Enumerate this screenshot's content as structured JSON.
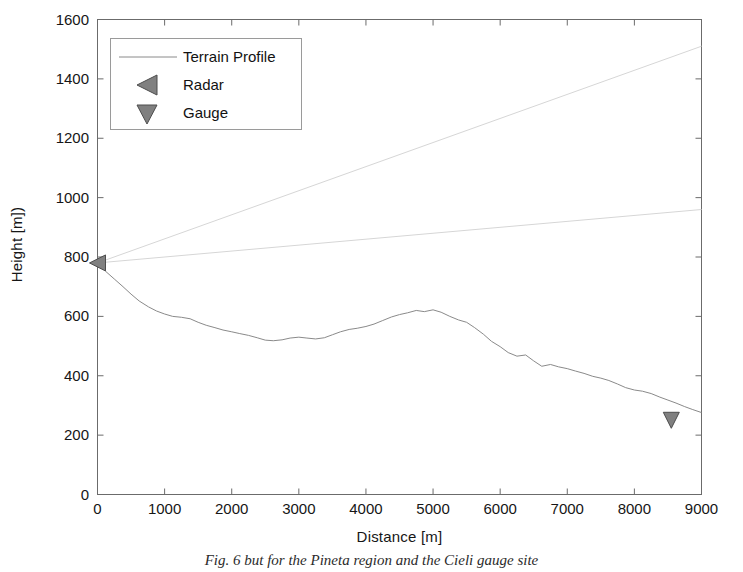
{
  "chart_data": {
    "type": "line",
    "title": "",
    "xlabel": "Distance [m]",
    "ylabel": "Height [m])",
    "xlim": [
      0,
      9000
    ],
    "ylim": [
      0,
      1600
    ],
    "xticks": [
      0,
      1000,
      2000,
      3000,
      4000,
      5000,
      6000,
      7000,
      8000,
      9000
    ],
    "yticks": [
      0,
      200,
      400,
      600,
      800,
      1000,
      1200,
      1400,
      1600
    ],
    "xtick_labels": [
      "0",
      "1000",
      "2000",
      "3000",
      "4000",
      "5000",
      "6000",
      "7000",
      "8000",
      "9000"
    ],
    "ytick_labels": [
      "0",
      "200",
      "400",
      "600",
      "800",
      "1000",
      "1200",
      "1400",
      "1600"
    ],
    "grid": false,
    "legend_position": "upper left",
    "legend_entries": [
      "Terrain Profile",
      "Radar",
      "Gauge"
    ],
    "series": [
      {
        "name": "Terrain Profile",
        "type": "line",
        "color": "#8a8a8a",
        "x": [
          0,
          120,
          250,
          380,
          500,
          620,
          760,
          880,
          1000,
          1120,
          1250,
          1380,
          1500,
          1620,
          1750,
          1870,
          2000,
          2120,
          2250,
          2380,
          2500,
          2620,
          2750,
          2870,
          3000,
          3120,
          3250,
          3380,
          3500,
          3620,
          3750,
          3870,
          4000,
          4120,
          4250,
          4380,
          4500,
          4620,
          4750,
          4870,
          5000,
          5120,
          5250,
          5380,
          5500,
          5620,
          5750,
          5870,
          6000,
          6120,
          6250,
          6380,
          6500,
          6620,
          6750,
          6870,
          7000,
          7120,
          7250,
          7380,
          7500,
          7620,
          7750,
          7870,
          8000,
          8120,
          8250,
          8380,
          8500,
          8620,
          8750,
          8870,
          9000
        ],
        "y": [
          780,
          752,
          726,
          700,
          675,
          652,
          632,
          618,
          608,
          600,
          597,
          592,
          580,
          570,
          562,
          554,
          548,
          542,
          536,
          528,
          520,
          518,
          521,
          527,
          530,
          527,
          524,
          528,
          538,
          548,
          556,
          560,
          566,
          574,
          586,
          598,
          606,
          612,
          620,
          616,
          622,
          614,
          600,
          588,
          580,
          562,
          540,
          516,
          498,
          478,
          466,
          470,
          450,
          432,
          438,
          430,
          424,
          416,
          408,
          398,
          392,
          384,
          372,
          360,
          352,
          348,
          340,
          328,
          318,
          308,
          296,
          286,
          276
        ],
        "linewidth": 1
      },
      {
        "name": "Radar beam upper",
        "type": "line",
        "color": "#d6d6d6",
        "x": [
          0,
          9000
        ],
        "y": [
          780,
          1510
        ],
        "linewidth": 1
      },
      {
        "name": "Radar beam lower",
        "type": "line",
        "color": "#d6d6d6",
        "x": [
          0,
          9000
        ],
        "y": [
          780,
          960
        ],
        "linewidth": 1
      }
    ],
    "markers": [
      {
        "name": "Radar",
        "shape": "triangle-left",
        "x": 0,
        "y": 780,
        "color": "#808080",
        "edge_color": "#4d4d4d",
        "size": 16
      },
      {
        "name": "Gauge",
        "shape": "triangle-down",
        "x": 8550,
        "y": 250,
        "color": "#808080",
        "edge_color": "#4d4d4d",
        "size": 16
      }
    ],
    "axis_color": "#666666",
    "text_color": "#161616"
  },
  "legend": {
    "terrain_label": "Terrain Profile",
    "radar_label": "Radar",
    "gauge_label": "Gauge"
  },
  "axes": {
    "xlabel": "Distance [m]",
    "ylabel": "Height [m])"
  },
  "caption": {
    "text": "Fig. 6 but for the Pineta region and the Cieli gauge site"
  }
}
